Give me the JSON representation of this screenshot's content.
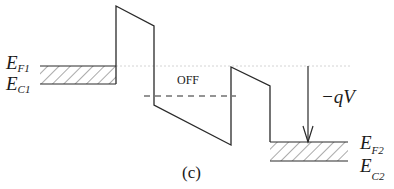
{
  "diagram": {
    "caption": "(c)",
    "state_label": "OFF",
    "voltage_label": "−qV",
    "left_electrode": {
      "fermi": {
        "main": "E",
        "sub": "F1"
      },
      "conduction": {
        "main": "E",
        "sub": "C1"
      }
    },
    "right_electrode": {
      "fermi": {
        "main": "E",
        "sub": "F2"
      },
      "conduction": {
        "main": "E",
        "sub": "C2"
      }
    },
    "colors": {
      "line": "#2a2a2a",
      "dotted": "#cccccc",
      "hatch": "#555555"
    }
  }
}
